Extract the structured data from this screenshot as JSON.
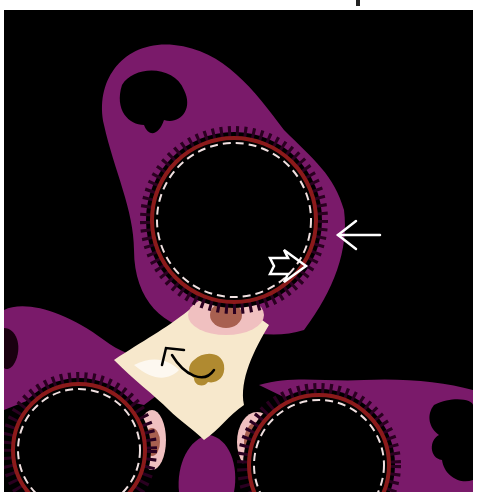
{
  "figure": {
    "kind": "anatomical illustration",
    "colors": {
      "background": "#000000",
      "tissue": "#7a1a6a",
      "membrane": "#8b1a1a",
      "dashed_lining": "#f0e0e0",
      "junction": "#f7e8cc",
      "pink_cell": "#f0c0c0",
      "nucleus": "#a86050",
      "macrophage": "#b08a30",
      "arrow": "#ffffff"
    },
    "annotations": [
      {
        "name": "thin-arrow",
        "style": "line arrow",
        "direction": "left",
        "color": "#ffffff"
      },
      {
        "name": "open-arrow",
        "style": "outlined block arrow",
        "direction": "right",
        "color": "#ffffff"
      },
      {
        "name": "curved-arrow",
        "style": "curved line arrow",
        "direction": "up-left",
        "color": "#000000"
      }
    ]
  }
}
